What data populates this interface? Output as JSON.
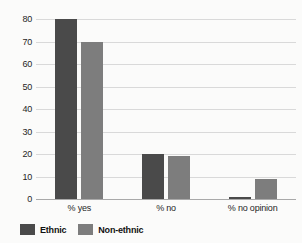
{
  "chart_data": {
    "type": "bar",
    "title": "",
    "subtitle": "",
    "xlabel": "",
    "ylabel": "",
    "categories": [
      "% yes",
      "% no",
      "% no opinion"
    ],
    "series": [
      {
        "name": "Ethnic",
        "color": "#4a4a4a",
        "values": [
          80,
          20,
          1
        ]
      },
      {
        "name": "Non-ethnic",
        "color": "#7d7d7d",
        "values": [
          70,
          19,
          9
        ]
      }
    ],
    "ylim": [
      0,
      80
    ],
    "yticks": [
      0,
      10,
      20,
      30,
      40,
      50,
      60,
      70,
      80
    ],
    "ytick_labels": [
      "0",
      "10",
      "20",
      "30",
      "40",
      "50",
      "60",
      "70",
      "80"
    ],
    "grid": true,
    "legend_position": "bottom-left",
    "background_color": "#fbfbfa",
    "gridline_color": "#d9d9d9",
    "axis_color": "#a9a9a9"
  }
}
